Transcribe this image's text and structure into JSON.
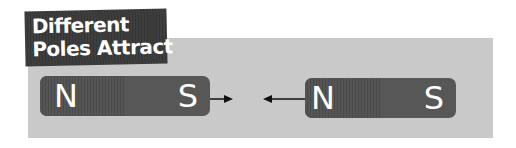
{
  "title": {
    "line1": "Different",
    "line2": "Poles Attract"
  },
  "magnets": [
    {
      "north_label": "N",
      "south_label": "S"
    },
    {
      "north_label": "N",
      "south_label": "S"
    }
  ],
  "arrows": [
    {
      "direction": "right",
      "meaning": "attraction"
    },
    {
      "direction": "left",
      "meaning": "attraction"
    }
  ],
  "colors": {
    "panel": "#c9c9c9",
    "magnet": "#575757",
    "title_bg": "#3a3a3a",
    "text": "#ffffff",
    "arrow": "#111111"
  }
}
